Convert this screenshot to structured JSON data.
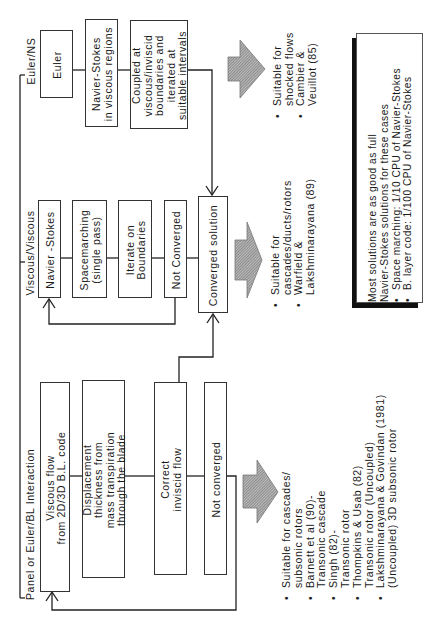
{
  "diagram": {
    "orientation": "rotated -90deg",
    "columns": [
      {
        "id": "panel-euler-bl",
        "heading": "Panel or Euler/BL Interaction",
        "steps": [
          {
            "id": "viscous-flow",
            "lines": [
              "Viscous flow",
              "from 2D/3D B.L. code"
            ]
          },
          {
            "id": "displacement",
            "lines": [
              "Displacement",
              "thickness from",
              "mass transpiration",
              "through the blade"
            ]
          },
          {
            "id": "correct-inviscid",
            "lines": [
              "Correct",
              "inviscid flow"
            ]
          },
          {
            "id": "not-converged",
            "lines": [
              "Not converged"
            ]
          }
        ],
        "notes": [
          {
            "lines": [
              "Suitable for cascades/",
              "subsonic rotors"
            ]
          },
          {
            "lines": [
              "Barnett et al (90)-",
              "Transonic cascade"
            ]
          },
          {
            "lines": [
              "Singh (82)-",
              "Transonic rotor"
            ]
          },
          {
            "lines": [
              "Thompkins & Usab (82)",
              "Transonic rotor (Uncoupled)"
            ]
          },
          {
            "lines": [
              "Lakshminarayana & Govindan (1981)",
              "(Uncoupled) 3D subsonic rotor"
            ]
          }
        ]
      },
      {
        "id": "viscous-viscous",
        "heading": "Viscous/Viscous",
        "steps": [
          {
            "id": "navier-stokes",
            "lines": [
              "Navier -Stokes"
            ]
          },
          {
            "id": "spacemarching",
            "lines": [
              "Spacemarching",
              "(single pass)"
            ]
          },
          {
            "id": "iterate-boundaries",
            "lines": [
              "Iterate on",
              "Boundaries"
            ]
          },
          {
            "id": "not-converged-2",
            "lines": [
              "Not Converged"
            ]
          },
          {
            "id": "converged-solution",
            "lines": [
              "Converged solution"
            ]
          }
        ],
        "notes": [
          {
            "lines": [
              "Suitable for",
              "cascades/ducts/rotors"
            ]
          },
          {
            "lines": [
              "Warfield &",
              "Lakshminarayana (89)"
            ]
          }
        ]
      },
      {
        "id": "euler-ns",
        "heading": "Euler/NS",
        "steps": [
          {
            "id": "euler",
            "lines": [
              "Euler"
            ]
          },
          {
            "id": "ns-viscous-regions",
            "lines": [
              "Navier-Stokes",
              "in viscous regions"
            ]
          },
          {
            "id": "coupled",
            "lines": [
              "Coupled at",
              "viscous/inviscid",
              "boundaries and",
              "iterated at",
              "suitable intervals"
            ]
          }
        ],
        "notes": [
          {
            "lines": [
              "Suitable for",
              "shocked flows"
            ]
          },
          {
            "lines": [
              "Cambier &",
              "Veuillot (85)"
            ]
          }
        ]
      }
    ],
    "summary_box": {
      "lines": [
        "Most solutions are as good as full",
        "Navier-Stokes solutions for these cases"
      ],
      "bullets": [
        "Space marching: 1/10 CPU of Navier-Stokes",
        "B. layer code: 1/100 CPU of Navier-Stokes"
      ]
    },
    "colors": {
      "line": "#222222",
      "box_border": "#333333",
      "hatch": "#8c8c8c",
      "background": "#ffffff"
    }
  }
}
